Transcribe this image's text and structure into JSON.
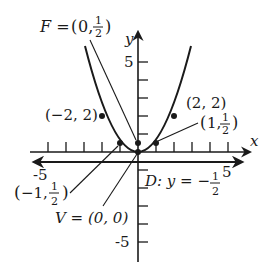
{
  "figure": {
    "equation": "y = x^2 / 2",
    "axes": {
      "x_label": "x",
      "y_label": "y",
      "x_tick_labels": [
        "-5",
        "5"
      ],
      "y_tick_labels": [
        "5",
        "-5"
      ],
      "x_range": [
        -5,
        5
      ],
      "y_range": [
        -5,
        5
      ]
    },
    "labels": {
      "focus": "F = (0, ½)",
      "focus_prefix": "F = ",
      "focus_open": "(0,",
      "focus_num": "1",
      "focus_den": "2",
      "focus_close": ")",
      "vertex": "V = (0, 0)",
      "directrix": "D: y = −½",
      "directrix_prefix": "D: y = −",
      "directrix_num": "1",
      "directrix_den": "2",
      "point_left_top": "(−2, 2)",
      "point_right_top": "(2, 2)",
      "point_right_low_open": "(1,",
      "point_right_low_num": "1",
      "point_right_low_den": "2",
      "point_right_low_close": ")",
      "point_left_low_open": "(−1,",
      "point_left_low_num": "1",
      "point_left_low_den": "2",
      "point_left_low_close": ")"
    },
    "points": [
      {
        "name": "(-2, 2)",
        "x": -2,
        "y": 2
      },
      {
        "name": "(2, 2)",
        "x": 2,
        "y": 2
      },
      {
        "name": "(-1, 1/2)",
        "x": -1,
        "y": 0.5
      },
      {
        "name": "(1, 1/2)",
        "x": 1,
        "y": 0.5
      },
      {
        "name": "F",
        "x": 0,
        "y": 0.5
      },
      {
        "name": "V",
        "x": 0,
        "y": 0
      }
    ],
    "colors": {
      "ink": "#1a1a1a",
      "background": "#ffffff"
    }
  }
}
